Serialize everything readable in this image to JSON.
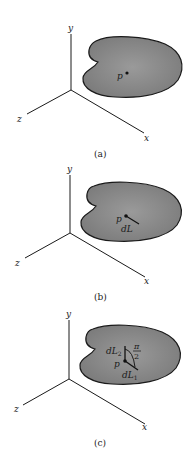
{
  "figure": {
    "colors": {
      "blob_fill": "#8a8a8a",
      "blob_stroke": "#1a1a1a",
      "axis": "#1a1a1a",
      "background": "#ffffff"
    },
    "panels": [
      {
        "caption": "(a)",
        "axes": {
          "x": "x",
          "y": "y",
          "z": "z"
        },
        "point_label": "p"
      },
      {
        "caption": "(b)",
        "axes": {
          "x": "x",
          "y": "y",
          "z": "z"
        },
        "point_label": "p",
        "vector_label": "dL"
      },
      {
        "caption": "(c)",
        "axes": {
          "x": "x",
          "y": "y",
          "z": "z"
        },
        "point_label": "p",
        "vector1_label": {
          "base": "dL",
          "sub": "1"
        },
        "vector2_label": {
          "base": "dL",
          "sub": "2"
        },
        "angle_label": {
          "num": "π",
          "den": "2"
        }
      }
    ]
  }
}
